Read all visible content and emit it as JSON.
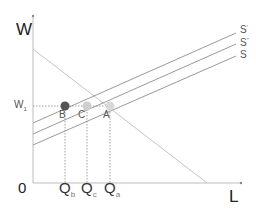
{
  "diagram": {
    "title": "",
    "axes": {
      "y_label": "W",
      "x_label": "L",
      "origin_label": "0"
    },
    "wage_level": {
      "label": "W",
      "subscript": "1"
    },
    "curves": {
      "demand": {
        "name": "D",
        "labeled": false
      },
      "supply": [
        {
          "label": "S",
          "superscript": "'",
          "position": "top"
        },
        {
          "label": "S",
          "superscript": "''",
          "position": "middle"
        },
        {
          "label": "S",
          "superscript": "",
          "position": "bottom"
        }
      ]
    },
    "points": [
      {
        "label": "B",
        "color": "#555555"
      },
      {
        "label": "C",
        "color": "#cfcfcf"
      },
      {
        "label": "A",
        "color": "#d8d8d8"
      }
    ],
    "quantities": [
      {
        "label": "Q",
        "subscript": "b"
      },
      {
        "label": "Q",
        "subscript": "c"
      },
      {
        "label": "Q",
        "subscript": "a"
      }
    ],
    "colors": {
      "axis": "#bdbdbd",
      "curve": "#9a9a9a",
      "demand": "#c4c4c4",
      "guide": "#8a8a8a"
    }
  }
}
